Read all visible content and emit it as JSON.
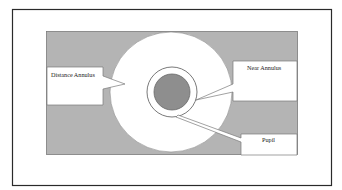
{
  "diagram": {
    "type": "eye-annulus-schematic",
    "colors": {
      "background": "#ffffff",
      "frame_stroke": "#2a2a2a",
      "field_gray": "#b4b4b4",
      "annulus_white": "#ffffff",
      "ring_stroke": "#6a6a6a",
      "pupil_gray": "#8e8e8e"
    },
    "labels": {
      "distance_annulus": "Distance Annulus",
      "near_annulus": "Near Annulus",
      "pupil": "Pupil"
    }
  }
}
